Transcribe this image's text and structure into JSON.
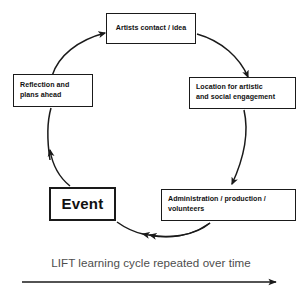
{
  "diagram": {
    "title": "LIFT learning cycle",
    "direction": "clockwise",
    "nodes": [
      {
        "id": "artists",
        "label": "Artists contact / idea",
        "position": "top"
      },
      {
        "id": "location",
        "label": "Location for artistic\nand social engagement",
        "position": "right"
      },
      {
        "id": "admin",
        "label": "Administration / production /\nvolunteers",
        "position": "bottom-right"
      },
      {
        "id": "event",
        "label": "Event",
        "position": "bottom-left",
        "emphasis": "bold-large"
      },
      {
        "id": "reflection",
        "label": "Reflection and\nplans ahead",
        "position": "left"
      }
    ],
    "arrows": [
      {
        "from": "artists",
        "to": "location",
        "style": "curved-clockwise"
      },
      {
        "from": "location",
        "to": "admin",
        "style": "curved-clockwise"
      },
      {
        "from": "admin",
        "to": "event",
        "style": "curved-clockwise"
      },
      {
        "from": "event",
        "to": "reflection",
        "style": "curved-clockwise"
      },
      {
        "from": "reflection",
        "to": "artists",
        "style": "curved-clockwise"
      }
    ]
  },
  "caption": {
    "text": "LIFT learning cycle repeated over time",
    "arrow": "right-arrow-timeline"
  },
  "colors": {
    "stroke": "#1a1a1a",
    "box_border": "#1a1a1a",
    "box_fill": "#ffffff",
    "label_text": "#111111",
    "caption_text": "#4d4d4d",
    "background": "#ffffff"
  }
}
